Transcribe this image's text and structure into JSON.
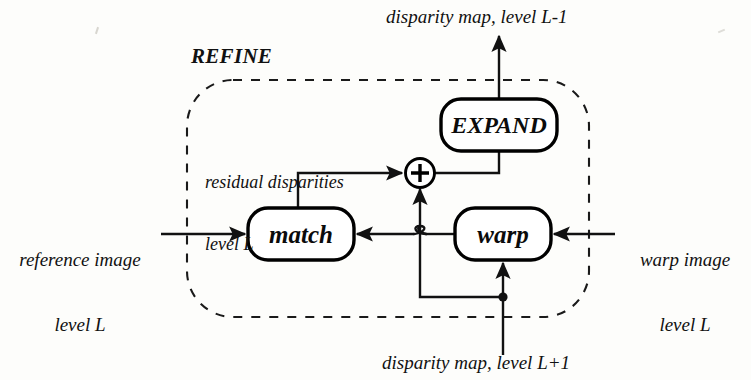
{
  "figure": {
    "type": "block-diagram",
    "title_group": "REFINE",
    "background_color": "#fdfdfb",
    "ink_color": "#111111"
  },
  "labels": {
    "top_output": "disparity map, level L-1",
    "bottom_input": "disparity map, level L+1",
    "left_input_line1": "reference image",
    "left_input_line2": "level L",
    "right_input_line1": "warp image",
    "right_input_line2": "level L",
    "annotation_line1": "residual disparities",
    "annotation_line2": "level L",
    "group_label": "REFINE"
  },
  "nodes": [
    {
      "id": "expand",
      "label": "EXPAND",
      "shape": "rounded-rect",
      "x": 441,
      "y": 99,
      "width": 116,
      "height": 52
    },
    {
      "id": "match",
      "label": "match",
      "shape": "rounded-rect",
      "x": 248,
      "y": 208,
      "width": 106,
      "height": 52
    },
    {
      "id": "warp",
      "label": "warp",
      "shape": "rounded-rect",
      "x": 455,
      "y": 208,
      "width": 96,
      "height": 52
    },
    {
      "id": "sum",
      "label": "+",
      "shape": "circle",
      "cx": 420,
      "cy": 173,
      "r": 15
    }
  ],
  "group_box": {
    "shape": "rounded-rect-dashed",
    "x": 187,
    "y": 80,
    "width": 402,
    "height": 237
  },
  "edges": [
    {
      "from": "left-input",
      "to": "match",
      "label": "reference image level L"
    },
    {
      "from": "match",
      "to": "sum",
      "label": "residual disparities level L"
    },
    {
      "from": "sum",
      "to": "expand",
      "label": ""
    },
    {
      "from": "expand",
      "to": "top-output",
      "label": "disparity map, level L-1"
    },
    {
      "from": "right-input",
      "to": "warp",
      "label": "warp image level L"
    },
    {
      "from": "warp",
      "to": "match",
      "label": ""
    },
    {
      "from": "bottom-input",
      "to": "warp",
      "label": "disparity map, level L+1"
    },
    {
      "from": "bottom-input-branch",
      "to": "sum",
      "label": ""
    }
  ],
  "junctions": [
    {
      "type": "dot",
      "x": 503,
      "y": 297
    },
    {
      "type": "line-hop",
      "x": 420,
      "y": 234
    }
  ]
}
